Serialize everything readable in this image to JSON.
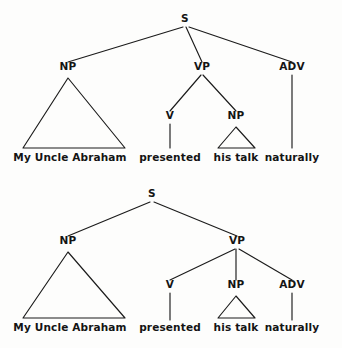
{
  "figure": {
    "sentence": "My Uncle Abraham presented his talk naturally",
    "background_color": "#fdfdfc",
    "ink_color": "#141414"
  },
  "trees": [
    {
      "id": "tree-top",
      "name": "adverb-attached-to-S",
      "description": "ADV attaches at the sentence level; S has three children: NP, VP, ADV",
      "nodes": [
        {
          "id": "s",
          "label": "S",
          "x": 185,
          "y": 22
        },
        {
          "id": "np1",
          "label": "NP",
          "x": 68,
          "y": 70
        },
        {
          "id": "vp",
          "label": "VP",
          "x": 202,
          "y": 70
        },
        {
          "id": "adv",
          "label": "ADV",
          "x": 292,
          "y": 70
        },
        {
          "id": "v",
          "label": "V",
          "x": 170,
          "y": 119
        },
        {
          "id": "np2",
          "label": "NP",
          "x": 236,
          "y": 119
        }
      ],
      "branches": [
        {
          "from": "s",
          "to": "np1",
          "x1": 183,
          "y1": 27,
          "x2": 68,
          "y2": 62
        },
        {
          "from": "s",
          "to": "vp",
          "x1": 186,
          "y1": 27,
          "x2": 202,
          "y2": 62
        },
        {
          "from": "s",
          "to": "adv",
          "x1": 189,
          "y1": 27,
          "x2": 292,
          "y2": 62
        },
        {
          "from": "vp",
          "to": "v",
          "x1": 201,
          "y1": 75,
          "x2": 170,
          "y2": 111
        },
        {
          "from": "vp",
          "to": "np2",
          "x1": 203,
          "y1": 75,
          "x2": 236,
          "y2": 111
        },
        {
          "from": "v",
          "to": "presented",
          "x1": 170,
          "y1": 124,
          "x2": 170,
          "y2": 148
        },
        {
          "from": "adv",
          "to": "naturally",
          "x1": 292,
          "y1": 75,
          "x2": 292,
          "y2": 148
        }
      ],
      "triangles": [
        {
          "under": "np1",
          "apex_x": 68,
          "apex_y": 78,
          "left_x": 23,
          "right_x": 125,
          "base_y": 148
        },
        {
          "under": "np2",
          "apex_x": 236,
          "apex_y": 127,
          "left_x": 218,
          "right_x": 255,
          "base_y": 148
        }
      ],
      "terminals": [
        {
          "id": "t1",
          "label": "My Uncle Abraham",
          "x": 70,
          "y": 161
        },
        {
          "id": "t2",
          "label": "presented",
          "x": 170,
          "y": 161
        },
        {
          "id": "t3",
          "label": "his talk",
          "x": 236,
          "y": 161
        },
        {
          "id": "t4",
          "label": "naturally",
          "x": 292,
          "y": 161
        }
      ]
    },
    {
      "id": "tree-bottom",
      "name": "adverb-attached-to-VP",
      "description": "ADV attaches inside VP; S has two children: NP and VP",
      "nodes": [
        {
          "id": "s",
          "label": "S",
          "x": 152,
          "y": 23
        },
        {
          "id": "np1",
          "label": "NP",
          "x": 68,
          "y": 70
        },
        {
          "id": "vp",
          "label": "VP",
          "x": 237,
          "y": 70
        },
        {
          "id": "v",
          "label": "V",
          "x": 170,
          "y": 114
        },
        {
          "id": "np2",
          "label": "NP",
          "x": 236,
          "y": 114
        },
        {
          "id": "adv",
          "label": "ADV",
          "x": 292,
          "y": 114
        }
      ],
      "branches": [
        {
          "from": "s",
          "to": "np1",
          "x1": 150,
          "y1": 28,
          "x2": 68,
          "y2": 62
        },
        {
          "from": "s",
          "to": "vp",
          "x1": 154,
          "y1": 28,
          "x2": 237,
          "y2": 62
        },
        {
          "from": "vp",
          "to": "v",
          "x1": 235,
          "y1": 75,
          "x2": 170,
          "y2": 106
        },
        {
          "from": "vp",
          "to": "np2",
          "x1": 236,
          "y1": 75,
          "x2": 236,
          "y2": 106
        },
        {
          "from": "vp",
          "to": "adv",
          "x1": 239,
          "y1": 75,
          "x2": 292,
          "y2": 106
        },
        {
          "from": "v",
          "to": "presented",
          "x1": 170,
          "y1": 119,
          "x2": 170,
          "y2": 146
        },
        {
          "from": "adv",
          "to": "naturally",
          "x1": 292,
          "y1": 119,
          "x2": 292,
          "y2": 146
        }
      ],
      "triangles": [
        {
          "under": "np1",
          "apex_x": 68,
          "apex_y": 78,
          "left_x": 23,
          "right_x": 125,
          "base_y": 144
        },
        {
          "under": "np2",
          "apex_x": 236,
          "apex_y": 122,
          "left_x": 218,
          "right_x": 255,
          "base_y": 144
        }
      ],
      "terminals": [
        {
          "id": "t1",
          "label": "My Uncle Abraham",
          "x": 70,
          "y": 157
        },
        {
          "id": "t2",
          "label": "presented",
          "x": 170,
          "y": 157
        },
        {
          "id": "t3",
          "label": "his talk",
          "x": 236,
          "y": 157
        },
        {
          "id": "t4",
          "label": "naturally",
          "x": 292,
          "y": 157
        }
      ]
    }
  ]
}
